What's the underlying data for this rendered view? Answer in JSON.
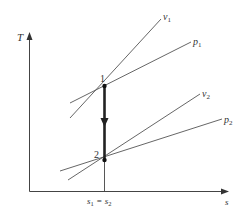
{
  "diagram": {
    "axes": {
      "y_label": "T",
      "x_label": "s"
    },
    "states": [
      {
        "id": "1",
        "label": "1"
      },
      {
        "id": "2",
        "label": "2"
      }
    ],
    "curves": [
      {
        "id": "v1",
        "label_base": "v",
        "label_sub": "1"
      },
      {
        "id": "p1",
        "label_base": "p",
        "label_sub": "1"
      },
      {
        "id": "v2",
        "label_base": "v",
        "label_sub": "2"
      },
      {
        "id": "p2",
        "label_base": "p",
        "label_sub": "2"
      }
    ],
    "x_tick": {
      "base1": "s",
      "sub1": "1",
      "eq": "=",
      "base2": "s",
      "sub2": "2"
    },
    "colors": {
      "line": "#444444",
      "process": "#222222"
    }
  }
}
